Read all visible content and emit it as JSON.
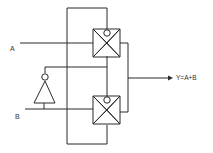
{
  "diagram": {
    "type": "cmos-transmission-gate-xor-circuit",
    "inputs": [
      {
        "label": "A"
      },
      {
        "label": "B"
      }
    ],
    "output": {
      "label": "Y=A+B"
    },
    "components": [
      {
        "name": "transmission-gate-top",
        "kind": "transmission-gate"
      },
      {
        "name": "transmission-gate-bottom",
        "kind": "transmission-gate"
      },
      {
        "name": "inverter",
        "kind": "not-gate",
        "input": "B"
      }
    ],
    "colors": {
      "line": "#2a2a2a",
      "background": "#ffffff"
    }
  }
}
